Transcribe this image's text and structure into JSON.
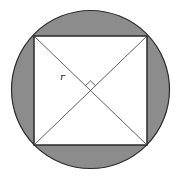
{
  "diagram": {
    "colors": {
      "shaded_region": "#8c8c8c",
      "stroke": "#2a2a2a",
      "square_fill": "#ffffff",
      "background": "#ffffff"
    },
    "circle": {
      "cx": 90.5,
      "cy": 89.5,
      "r": 79
    },
    "square": {
      "x1": 34,
      "y1": 36,
      "x2": 147,
      "y2": 145
    },
    "center": {
      "x": 90.5,
      "y": 90.5
    },
    "labels": {
      "radius": "r"
    },
    "right_angle_marker": true
  }
}
